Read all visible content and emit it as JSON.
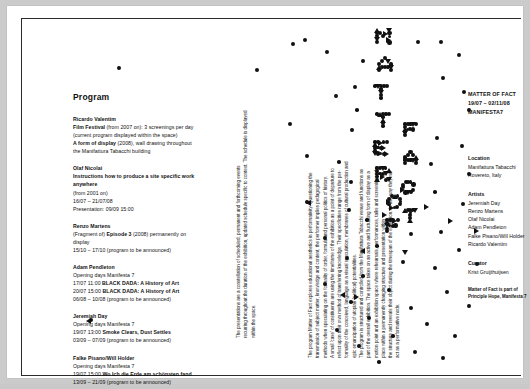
{
  "poster": {
    "background_color": "#c9c9c9",
    "paper_color": "#ffffff",
    "ink_color": "#111111"
  },
  "program": {
    "heading": "Program",
    "entries": [
      {
        "artist": "Ricardo Valentim",
        "lines": [
          "Film Festival (from 2007 on): 3 screenings per day",
          "(current program displayed within the space)",
          "A form of display (2008), wall drawing throughout",
          "the Manifattura Tabacchi building"
        ],
        "bold_titles": [
          "Film Festival",
          "A form of display"
        ]
      },
      {
        "artist": "Olaf Nicolai",
        "lines": [
          "Instructions how to produce a site specific work anywhere",
          "(from 2001 on)",
          "16/07 – 21/07/08",
          "Presentation: 09/09 15:00"
        ],
        "bold_titles": [
          "Instructions how to produce a site specific work anywhere"
        ]
      },
      {
        "artist": "Renzo Martens",
        "lines": [
          "(Fragment of) Episode 3 (2008) permanently on display",
          "15/10 – 17/10 (program to be announced)"
        ],
        "bold_titles": [
          "Episode 3"
        ]
      },
      {
        "artist": "Adam Pendleton",
        "lines": [
          "Opening days Manifesta 7",
          "17/07 11:00 BLACK DADA: A History of Art",
          "20/07 15:00 BLACK DADA: A History of Art",
          "06/08 – 10/08 (program to be announced)"
        ],
        "bold_titles": [
          "BLACK DADA: A History of Art"
        ]
      },
      {
        "artist": "Jeremiah Day",
        "lines": [
          "Opening days Manifesta 7",
          "19/07 13:00 Smoke Clears, Dust Settles",
          "03/09 – 07/09 (program to be announced)"
        ],
        "bold_titles": [
          "Smoke Clears, Dust Settles"
        ]
      },
      {
        "artist": "Falke Pisano/Will Holder",
        "lines": [
          "Opening days Manifesta 7",
          "19/07 15:00 Wo Ich die Erde am schönsten fand",
          "13/09 – 21/09 (program to be announced)"
        ],
        "bold_titles": [
          "Wo Ich die Erde am schönsten fand"
        ]
      }
    ]
  },
  "essay": {
    "column_left": [
      "The presentations are a constellation of scheduled, permanent and forthcoming events",
      "recurring throughout the duration of the exhibition, updated schedule specific to context. The schedule is displayed",
      "within the space."
    ],
    "column_right": [
      "The program Matter of Fact explores educational aesthetics in performativity. Questioning the",
      "transmission of subject matter, knowledge and content, the performer implies pedagogical",
      "methods when speculating on the formality of order, formula and personal politics of history.",
      "A small 'case' of constituents are using the timeframe of the exhibition as a point of departure to",
      "reflect upon their own method of transferring knowledge. Their specificities range from the per-",
      "formality of the conceived, language as a visual speculation, membranes of cultural production and",
      "epic emancipation of utopian (political) potentialities.",
      "The program is structured and controlled from the Manifattura Tabacchi venue and functions as",
      "part of the overall exhibition. The space takes on an active and fluctuating form of display as a",
      "motion point and an exhibition space where rehearsals, performances, talks and screenings take",
      "place within a permanently changing structure and presentation within",
      "the structure and reveals their object during the timespan of the exhibition. In this way they will",
      "act as a performative node."
    ]
  },
  "info": {
    "title_lines": [
      "MATTER OF FACT",
      "19/07 – 02/11/08",
      "MANIFESTA7"
    ],
    "groups": [
      {
        "label": "Location",
        "values": [
          "Manifattura Tabacchi",
          "Rovereto, Italy"
        ]
      },
      {
        "label": "Artists",
        "values": [
          "Jeremiah Day",
          "Renzo Martens",
          "Olaf Nicolai",
          "Adam Pendleton",
          "Falke Pisano/Will Holder",
          "Ricardo Valentim"
        ]
      },
      {
        "label": "Curator",
        "values": [
          "Krist Gruijthuijsen"
        ]
      }
    ],
    "footnote_lines": [
      "Matter of Fact is part of",
      "Principle Hope, Manifesta 7"
    ]
  },
  "composition": {
    "description": "dot-matrix letterforms spelling MATTER OF FACT built from circles and triangles",
    "letters": [
      "M",
      "A",
      "T",
      "T",
      "E",
      "R",
      "O",
      "F",
      "F",
      "A",
      "C",
      "T"
    ]
  }
}
